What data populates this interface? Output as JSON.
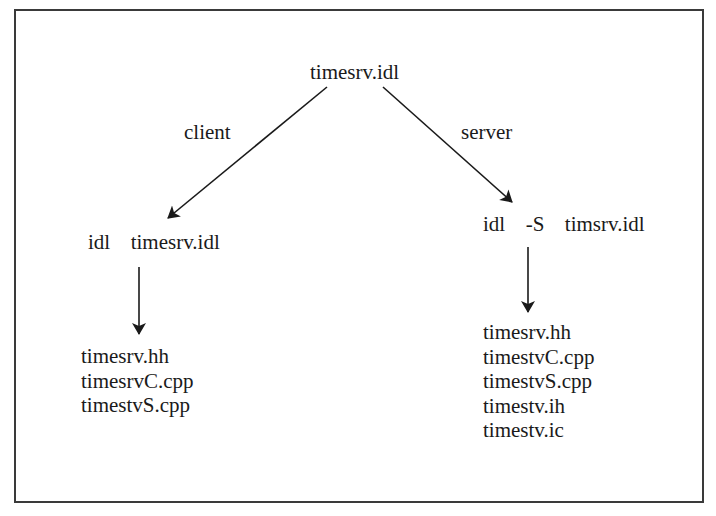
{
  "diagram": {
    "root": {
      "label": "timesrv.idl"
    },
    "edges": [
      {
        "label": "client",
        "from": "root",
        "to": "client_cmd"
      },
      {
        "label": "server",
        "from": "root",
        "to": "server_cmd"
      },
      {
        "label": "",
        "from": "client_cmd",
        "to": "client_files"
      },
      {
        "label": "",
        "from": "server_cmd",
        "to": "server_files"
      }
    ],
    "client": {
      "edge_label": "client",
      "command": "idl  timesrv.idl",
      "files": [
        "timesrv.hh",
        "timesrvC.cpp",
        "timestvS.cpp"
      ]
    },
    "server": {
      "edge_label": "server",
      "command": "idl  -S  timsrv.idl",
      "files": [
        "timesrv.hh",
        "timestvC.cpp",
        "timestvS.cpp",
        "timestv.ih",
        "timestv.ic"
      ]
    },
    "colors": {
      "stroke": "#1a1a1a",
      "border": "#3a3a3a",
      "background": "#ffffff"
    }
  }
}
